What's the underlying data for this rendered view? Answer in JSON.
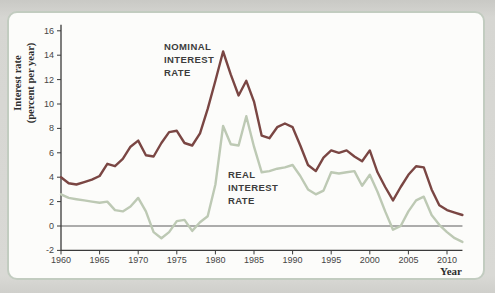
{
  "figure": {
    "y_axis_label_lines": [
      "Interest rate",
      "(percent per year)"
    ],
    "x_axis_label": "Year",
    "annotations": {
      "nominal_lines": [
        "NOMINAL",
        "INTEREST",
        "RATE"
      ],
      "real_lines": [
        "REAL",
        "INTEREST",
        "RATE"
      ]
    }
  },
  "chart_data": {
    "type": "line",
    "title": "",
    "xlabel": "Year",
    "ylabel": "Interest rate (percent per year)",
    "xlim": [
      1960,
      2012
    ],
    "ylim": [
      -2,
      16
    ],
    "xticks": [
      1960,
      1965,
      1970,
      1975,
      1980,
      1985,
      1990,
      1995,
      2000,
      2005,
      2010
    ],
    "yticks": [
      -2,
      0,
      2,
      4,
      6,
      8,
      10,
      12,
      14,
      16
    ],
    "grid": "off",
    "zero_line": 0,
    "x": [
      1960,
      1961,
      1962,
      1963,
      1964,
      1965,
      1966,
      1967,
      1968,
      1969,
      1970,
      1971,
      1972,
      1973,
      1974,
      1975,
      1976,
      1977,
      1978,
      1979,
      1980,
      1981,
      1982,
      1983,
      1984,
      1985,
      1986,
      1987,
      1988,
      1989,
      1990,
      1991,
      1992,
      1993,
      1994,
      1995,
      1996,
      1997,
      1998,
      1999,
      2000,
      2001,
      2002,
      2003,
      2004,
      2005,
      2006,
      2007,
      2008,
      2009,
      2010,
      2011,
      2012
    ],
    "series": [
      {
        "name": "NOMINAL INTEREST RATE",
        "color": "#7a4643",
        "values": [
          4.0,
          3.5,
          3.4,
          3.6,
          3.8,
          4.1,
          5.1,
          4.9,
          5.5,
          6.5,
          7.0,
          5.8,
          5.7,
          6.8,
          7.7,
          7.8,
          6.8,
          6.6,
          7.6,
          9.6,
          11.9,
          14.3,
          12.4,
          10.7,
          11.9,
          10.2,
          7.4,
          7.2,
          8.1,
          8.4,
          8.1,
          6.6,
          5.0,
          4.5,
          5.6,
          6.2,
          6.0,
          6.2,
          5.7,
          5.3,
          6.2,
          4.4,
          3.2,
          2.1,
          3.2,
          4.2,
          4.9,
          4.8,
          3.0,
          1.7,
          1.3,
          1.1,
          0.9
        ]
      },
      {
        "name": "REAL INTEREST RATE",
        "color": "#bdc9b4",
        "values": [
          2.6,
          2.3,
          2.2,
          2.1,
          2.0,
          1.9,
          2.0,
          1.3,
          1.2,
          1.6,
          2.3,
          1.2,
          -0.5,
          -1.0,
          -0.5,
          0.4,
          0.5,
          -0.4,
          0.3,
          0.8,
          3.4,
          8.2,
          6.7,
          6.6,
          9.0,
          6.5,
          4.4,
          4.5,
          4.7,
          4.8,
          5.0,
          4.1,
          3.0,
          2.6,
          2.9,
          4.4,
          4.3,
          4.4,
          4.5,
          3.3,
          4.2,
          2.8,
          1.2,
          -0.3,
          0.0,
          1.2,
          2.1,
          2.4,
          0.9,
          0.1,
          -0.5,
          -1.0,
          -1.3
        ]
      }
    ],
    "colors": {
      "axis": "#3a3a3a",
      "zero_line": "#5c5c5c",
      "tick_text": "#454545",
      "frame_border": "#c2ccc0",
      "panel_bg": "#fcfcfa",
      "page_bg": "#d4d4d0"
    }
  }
}
